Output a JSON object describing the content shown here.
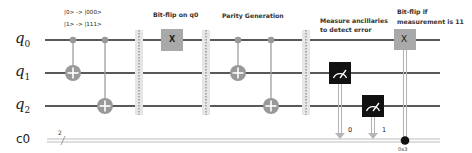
{
  "diagram": {
    "type": "quantum-circuit"
  },
  "wires": {
    "quantum": [
      {
        "name": "q",
        "index": "0"
      },
      {
        "name": "q",
        "index": "1"
      },
      {
        "name": "q",
        "index": "2"
      }
    ],
    "classical": {
      "name": "c0",
      "bits": "2"
    }
  },
  "annotations": {
    "encoding_line1": "|0> -> |000>",
    "encoding_line2": "|1> -> |111>",
    "bitflip_title": "Bit-flip on q0",
    "parity_title": "Parity Generation",
    "measure_line1": "Measure ancillaries",
    "measure_line2": "to detect error",
    "correct_line1": "Bit-flip if",
    "correct_line2": "measurement is 11"
  },
  "gates": {
    "x_error_label": "X",
    "x_correct_label": "X",
    "measure_bit_0": "0",
    "measure_bit_1": "1",
    "condition_value": "0x3"
  },
  "colors": {
    "wire": "#222222",
    "classical_wire": "#bdbdbd",
    "cnot": "#999999",
    "x_gate": "#a9a9a9",
    "measure_box": "#111111",
    "barrier": "#e3e3e3"
  }
}
